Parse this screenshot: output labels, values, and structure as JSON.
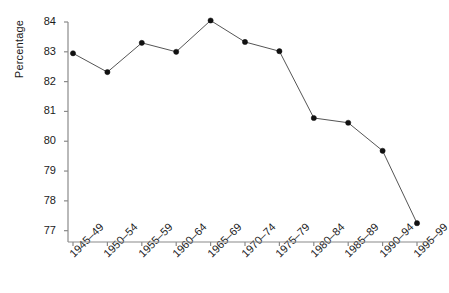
{
  "chart_data": {
    "type": "line",
    "title": "",
    "xlabel": "",
    "ylabel": "Percentage",
    "categories": [
      "1945–49",
      "1950–54",
      "1955–59",
      "1960–64",
      "1965–69",
      "1970–74",
      "1975–79",
      "1980–84",
      "1985–89",
      "1990–94",
      "1995–99"
    ],
    "values": [
      82.95,
      82.32,
      83.3,
      83.0,
      84.05,
      83.33,
      83.02,
      80.78,
      80.62,
      79.68,
      77.25
    ],
    "series": [
      {
        "name": "Percentage",
        "values": [
          82.95,
          82.32,
          83.3,
          83.0,
          84.05,
          83.33,
          83.02,
          80.78,
          80.62,
          79.68,
          77.25
        ]
      }
    ],
    "ylim": [
      76.62,
      84.0
    ],
    "yticks": [
      77,
      78,
      79,
      80,
      81,
      82,
      83,
      84
    ],
    "ytick_labels": [
      "77",
      "78",
      "79",
      "80",
      "81",
      "82",
      "83",
      "84"
    ],
    "grid": false,
    "legend": false,
    "legend_position": "none",
    "line_color": "#555555",
    "marker_color": "#111111",
    "marker_shape": "circle",
    "axis_color": "#8a8a8a",
    "text_color": "#1a1a1a",
    "background": "#ffffff"
  },
  "axes": {
    "y_title": "Percentage"
  }
}
